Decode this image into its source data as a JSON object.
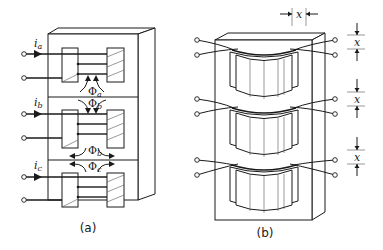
{
  "figure": {
    "panels": [
      {
        "id": "a",
        "caption": "(a)",
        "description": "Three-phase core-type transformer core with three legs stacked vertically, each leg with primary and secondary windings",
        "phases": [
          {
            "current_label": "i",
            "current_sub": "a",
            "flux_label": "Φ",
            "flux_sub": "a",
            "flux_direction": "up"
          },
          {
            "current_label": "i",
            "current_sub": "b",
            "flux_label": "Φ",
            "flux_sub": "b",
            "flux_direction": "down-split"
          },
          {
            "current_label": "i",
            "current_sub": "c",
            "flux_label": "Φ",
            "flux_sub": "c",
            "flux_direction": "split"
          }
        ]
      },
      {
        "id": "b",
        "caption": "(b)",
        "description": "Three-phase transformer with cylindrical windings and air gaps of width x",
        "dimension_label": "x",
        "gap_labels": [
          "x",
          "x",
          "x"
        ]
      }
    ]
  }
}
